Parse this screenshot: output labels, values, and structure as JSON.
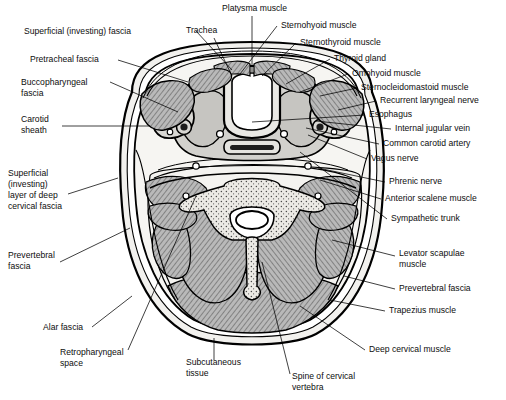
{
  "figure": {
    "type": "anatomical-cross-section",
    "background_color": "#ffffff",
    "line_color": "#000000",
    "fill_colors": {
      "subcutaneous": "#f0efec",
      "muscle": "#b9b9b9",
      "muscle_hatch": "#7a7a7a",
      "fascia_space": "#ffffff",
      "bone": "#e8e7e3",
      "vessel_dark": "#2a2a2a",
      "gland": "#cfcfcf"
    }
  },
  "labels_left": [
    {
      "id": "superficial-investing-fascia",
      "lines": [
        "Superficial (investing) fascia"
      ],
      "x": 24,
      "y": 34
    },
    {
      "id": "pretracheal-fascia",
      "lines": [
        "Pretracheal fascia"
      ],
      "x": 30,
      "y": 62
    },
    {
      "id": "buccopharyngeal-fascia",
      "lines": [
        "Buccopharyngeal",
        "fascia"
      ],
      "x": 21,
      "y": 85
    },
    {
      "id": "carotid-sheath",
      "lines": [
        "Carotid",
        "sheath"
      ],
      "x": 21,
      "y": 122
    },
    {
      "id": "superficial-investing-layer-deep-cervical-fascia",
      "lines": [
        "Superficial",
        "(investing)",
        "layer of deep",
        "cervical fascia"
      ],
      "x": 8,
      "y": 176
    },
    {
      "id": "prevertebral-fascia-left",
      "lines": [
        "Prevertebral",
        "fascia"
      ],
      "x": 8,
      "y": 258
    },
    {
      "id": "alar-fascia",
      "lines": [
        "Alar fascia"
      ],
      "x": 43,
      "y": 330
    },
    {
      "id": "retropharyngeal-space",
      "lines": [
        "Retropharyngeal",
        "space"
      ],
      "x": 60,
      "y": 355
    }
  ],
  "labels_top": [
    {
      "id": "platysma-muscle",
      "lines": [
        "Platysma muscle"
      ],
      "x": 222,
      "y": 11
    },
    {
      "id": "trachea",
      "lines": [
        "Trachea"
      ],
      "x": 186,
      "y": 33
    }
  ],
  "labels_bottom": [
    {
      "id": "subcutaneous-tissue",
      "lines": [
        "Subcutaneous",
        "tissue"
      ],
      "x": 186,
      "y": 365
    },
    {
      "id": "spine-of-cervical-vertebra",
      "lines": [
        "Spine of cervical",
        "vertebra"
      ],
      "x": 292,
      "y": 379
    }
  ],
  "labels_right": [
    {
      "id": "sternohyoid-muscle",
      "lines": [
        "Sternohyoid muscle"
      ],
      "x": 281,
      "y": 28
    },
    {
      "id": "sternothyroid-muscle",
      "lines": [
        "Sternothyroid muscle"
      ],
      "x": 300,
      "y": 45
    },
    {
      "id": "thyroid-gland",
      "lines": [
        "Thyroid gland"
      ],
      "x": 334,
      "y": 61
    },
    {
      "id": "omohyoid-muscle",
      "lines": [
        "Omohyoid muscle"
      ],
      "x": 352,
      "y": 76
    },
    {
      "id": "sternocleidomastoid-muscle",
      "lines": [
        "Sternocleidomastoid muscle"
      ],
      "x": 361,
      "y": 90
    },
    {
      "id": "recurrent-laryngeal-nerve",
      "lines": [
        "Recurrent laryngeal nerve"
      ],
      "x": 380,
      "y": 103
    },
    {
      "id": "esophagus",
      "lines": [
        "Esophagus"
      ],
      "x": 369,
      "y": 117
    },
    {
      "id": "internal-jugular-vein",
      "lines": [
        "Internal jugular vein"
      ],
      "x": 395,
      "y": 131
    },
    {
      "id": "common-carotid-artery",
      "lines": [
        "Common carotid artery"
      ],
      "x": 383,
      "y": 146
    },
    {
      "id": "vagus-nerve",
      "lines": [
        "Vagus nerve"
      ],
      "x": 371,
      "y": 161
    },
    {
      "id": "phrenic-nerve",
      "lines": [
        "Phrenic nerve"
      ],
      "x": 389,
      "y": 184
    },
    {
      "id": "anterior-scalene-muscle",
      "lines": [
        "Anterior scalene muscle"
      ],
      "x": 385,
      "y": 201
    },
    {
      "id": "sympathetic-trunk",
      "lines": [
        "Sympathetic trunk"
      ],
      "x": 391,
      "y": 221
    },
    {
      "id": "levator-scapulae-muscle",
      "lines": [
        "Levator scapulae",
        "muscle"
      ],
      "x": 399,
      "y": 256
    },
    {
      "id": "prevertebral-fascia-right",
      "lines": [
        "Prevertebral fascia"
      ],
      "x": 399,
      "y": 291
    },
    {
      "id": "trapezius-muscle",
      "lines": [
        "Trapezius muscle"
      ],
      "x": 389,
      "y": 313
    },
    {
      "id": "deep-cervical-muscle",
      "lines": [
        "Deep cervical muscle"
      ],
      "x": 369,
      "y": 352
    }
  ],
  "leader_lines": [
    {
      "id": "lead-superficial-investing-fascia",
      "d": "M196,31 L232,70"
    },
    {
      "id": "lead-pretracheal-fascia",
      "d": "M118,60 L188,82"
    },
    {
      "id": "lead-buccopharyngeal-fascia",
      "d": "M110,82 L178,112"
    },
    {
      "id": "lead-carotid-sheath",
      "d": "M62,126 L150,126"
    },
    {
      "id": "lead-superficial-deep-layer",
      "d": "M68,194 L118,178"
    },
    {
      "id": "lead-prevertebral-left",
      "d": "M60,262 L130,228"
    },
    {
      "id": "lead-alar-fascia",
      "d": "M92,327 L132,296"
    },
    {
      "id": "lead-retropharyngeal-space",
      "d": "M128,350 L196,196"
    },
    {
      "id": "lead-platysma",
      "d": "M252,16 L252,72"
    },
    {
      "id": "lead-trachea",
      "d": "M214,38 L232,76"
    },
    {
      "id": "lead-subcutaneous",
      "d": "M214,360 L214,338"
    },
    {
      "id": "lead-spine-vertebra",
      "d": "M290,374 L262,262"
    },
    {
      "id": "lead-sternohyoid",
      "d": "M277,26 L240,74"
    },
    {
      "id": "lead-sternothyroid",
      "d": "M296,43 L262,76"
    },
    {
      "id": "lead-thyroid-gland",
      "d": "M330,59 L286,84"
    },
    {
      "id": "lead-omohyoid",
      "d": "M348,74 L300,92"
    },
    {
      "id": "lead-sternocleidomastoid",
      "d": "M357,88 L320,96"
    },
    {
      "id": "lead-recurrent-laryngeal",
      "d": "M376,101 L338,110"
    },
    {
      "id": "lead-esophagus",
      "d": "M365,115 L252,122"
    },
    {
      "id": "lead-internal-jugular",
      "d": "M391,129 L316,121"
    },
    {
      "id": "lead-common-carotid",
      "d": "M379,144 L306,128"
    },
    {
      "id": "lead-vagus-nerve",
      "d": "M367,159 L308,135"
    },
    {
      "id": "lead-phrenic-nerve",
      "d": "M385,182 L318,168"
    },
    {
      "id": "lead-anterior-scalene",
      "d": "M381,199 L320,180"
    },
    {
      "id": "lead-sympathetic-trunk",
      "d": "M387,219 L300,152"
    },
    {
      "id": "lead-levator-scapulae",
      "d": "M395,256 L332,240"
    },
    {
      "id": "lead-prevertebral-right",
      "d": "M395,289 L344,276"
    },
    {
      "id": "lead-trapezius",
      "d": "M385,311 L330,300"
    },
    {
      "id": "lead-deep-cervical",
      "d": "M365,350 L300,306"
    }
  ]
}
